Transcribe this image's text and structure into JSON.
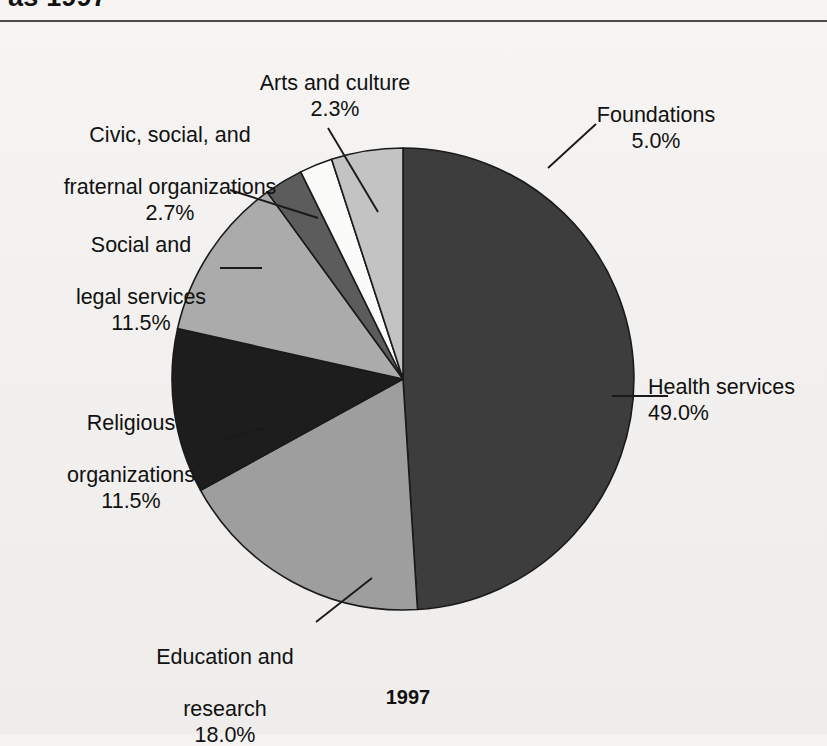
{
  "page": {
    "cropped_heading": "as 1997",
    "caption": "1997",
    "background_hex": "#f2f1ef",
    "rule_hex": "#4b4b4b"
  },
  "chart_data": {
    "type": "pie",
    "title": "",
    "caption": "1997",
    "units": "percent",
    "total": 100.0,
    "legend": "none (direct labels with leader lines)",
    "start_angle_deg": 0,
    "direction": "clockwise",
    "categories": [
      "Health services",
      "Education and research",
      "Religious organizations",
      "Social and legal services",
      "Civic, social, and fraternal organizations",
      "Arts and culture",
      "Foundations"
    ],
    "values": [
      49.0,
      18.0,
      11.5,
      11.5,
      2.7,
      2.3,
      5.0
    ],
    "slices": [
      {
        "name": "Health services",
        "label": "Health services",
        "value": 49.0,
        "value_text": "49.0%",
        "color": "#3d3d3d"
      },
      {
        "name": "Education and research",
        "label": "Education and\nresearch",
        "value": 18.0,
        "value_text": "18.0%",
        "color": "#9e9e9e"
      },
      {
        "name": "Religious organizations",
        "label": "Religious\norganizations",
        "value": 11.5,
        "value_text": "11.5%",
        "color": "#1d1d1d"
      },
      {
        "name": "Social and legal services",
        "label": "Social and\nlegal services",
        "value": 11.5,
        "value_text": "11.5%",
        "color": "#ababab"
      },
      {
        "name": "Civic, social, and fraternal organizations",
        "label": "Civic, social, and\nfraternal organizations",
        "value": 2.7,
        "value_text": "2.7%",
        "color": "#5c5c5c"
      },
      {
        "name": "Arts and culture",
        "label": "Arts and culture",
        "value": 2.3,
        "value_text": "2.3%",
        "color": "#fbfbf9"
      },
      {
        "name": "Foundations",
        "label": "Foundations",
        "value": 5.0,
        "value_text": "5.0%",
        "color": "#c3c3c3"
      }
    ]
  },
  "labels": {
    "arts": {
      "name": "Arts and culture",
      "pct": "2.3%"
    },
    "foundations": {
      "name": "Foundations",
      "pct": "5.0%"
    },
    "civic_line1": "Civic, social, and",
    "civic_line2": "fraternal organizations",
    "civic_pct": "2.7%",
    "social_line1": "Social and",
    "social_line2": "legal services",
    "social_pct": "11.5%",
    "religious_line1": "Religious",
    "religious_line2": "organizations",
    "religious_pct": "11.5%",
    "education_line1": "Education and",
    "education_line2": "research",
    "education_pct": "18.0%",
    "health_name": "Health services",
    "health_pct": "49.0%"
  }
}
